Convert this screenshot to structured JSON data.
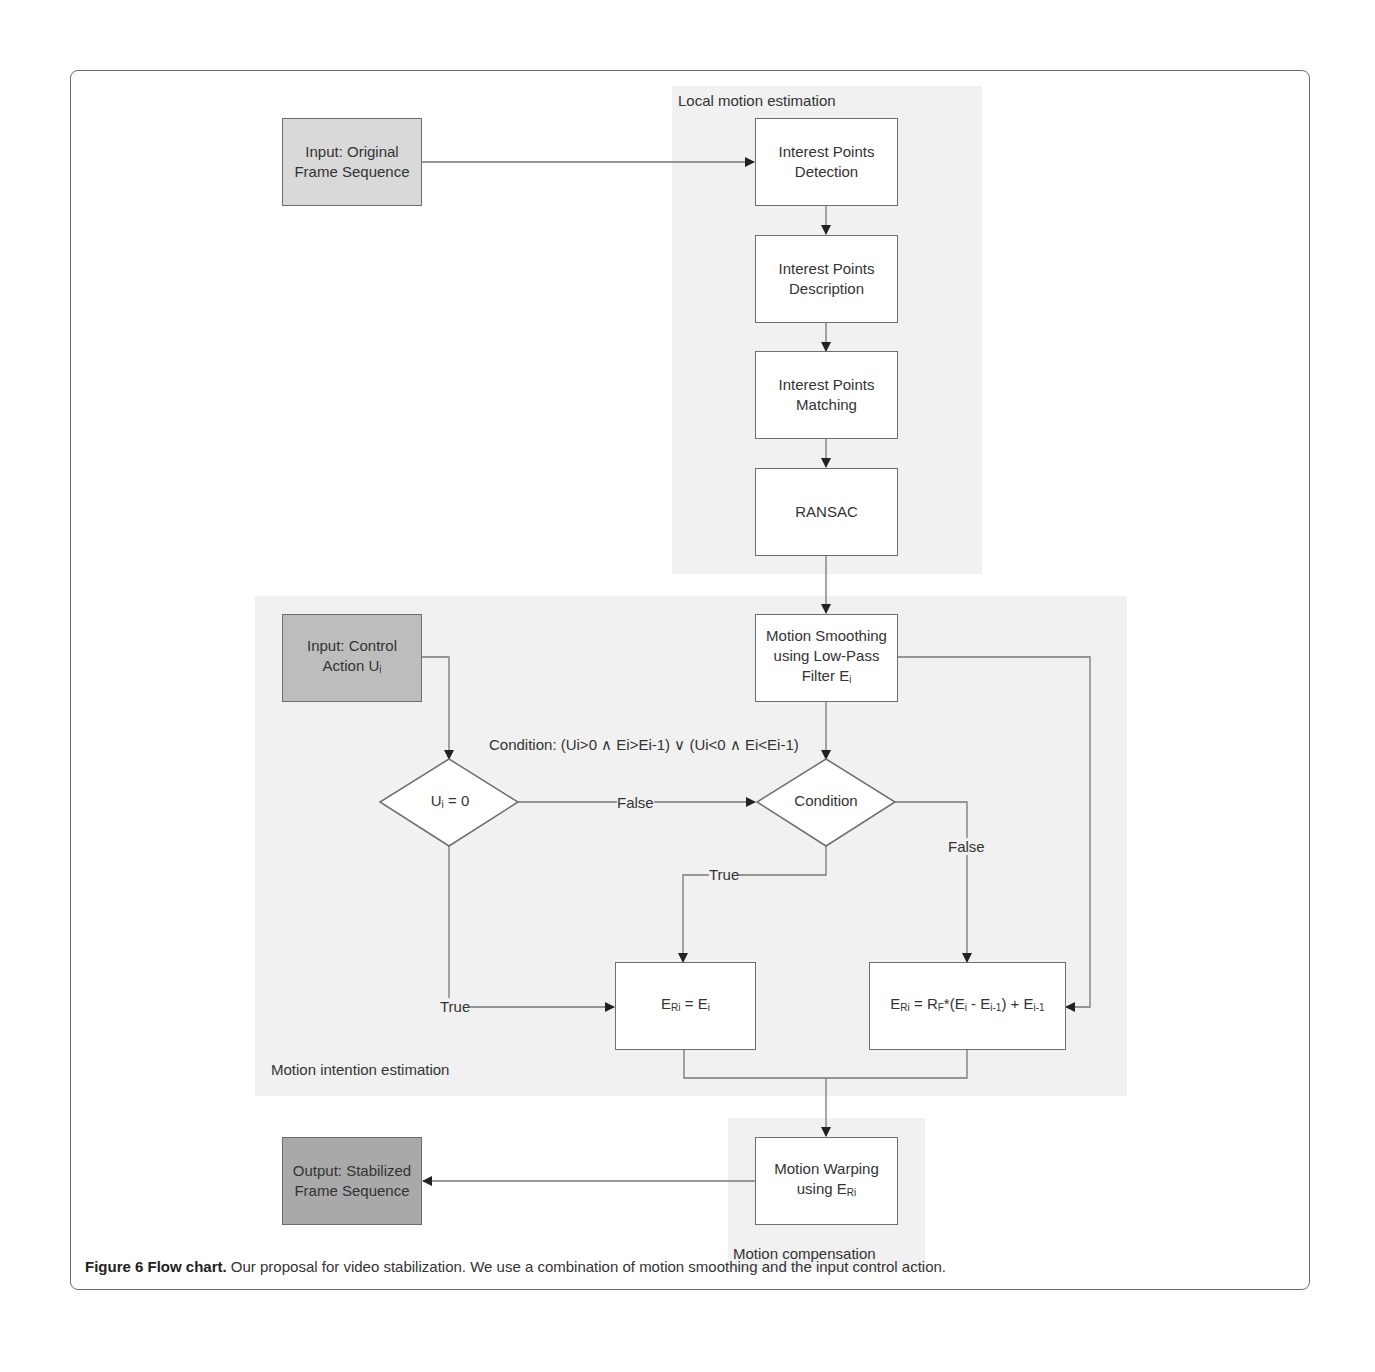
{
  "regions": {
    "local_motion": "Local motion estimation",
    "motion_intention": "Motion intention estimation",
    "motion_compensation": "Motion compensation"
  },
  "nodes": {
    "input_original": {
      "line1": "Input: Original",
      "line2": "Frame Sequence"
    },
    "ip_detection": {
      "line1": "Interest Points",
      "line2": "Detection"
    },
    "ip_description": {
      "line1": "Interest Points",
      "line2": "Description"
    },
    "ip_matching": {
      "line1": "Interest Points",
      "line2": "Matching"
    },
    "ransac": {
      "line1": "RANSAC"
    },
    "motion_smoothing": {
      "line1": "Motion Smoothing",
      "line2": "using Low-Pass",
      "line3": "Filter E",
      "line3_sub": "i"
    },
    "input_control": {
      "line1": "Input: Control",
      "line2": "Action U",
      "line2_sub": "i"
    },
    "ui_zero": {
      "pre": "U",
      "sub": "i",
      "post": " = 0"
    },
    "condition": {
      "text": "Condition"
    },
    "eri_ei": {
      "a": "E",
      "a_sub": "Ri",
      "b": " = E",
      "b_sub": "i"
    },
    "eri_formula": {
      "a": "E",
      "a_sub": "Ri",
      "b": " = R",
      "b_sub": "F",
      "c": "*(E",
      "c_sub": "i",
      "d": " - E",
      "d_sub": "i-1",
      "e": ") + E",
      "e_sub": "i-1"
    },
    "motion_warping": {
      "line1": "Motion Warping",
      "line2": "using E",
      "line2_sub": "Ri"
    },
    "output": {
      "line1": "Output: Stabilized",
      "line2": "Frame Sequence"
    }
  },
  "condition_label": "Condition: (Ui>0 ∧ Ei>Ei-1) ∨ (Ui<0 ∧ Ei<Ei-1)",
  "edge_labels": {
    "false_mid": "False",
    "false_right": "False",
    "true_cond": "True",
    "true_left": "True"
  },
  "caption": {
    "bold": "Figure 6 Flow chart.",
    "text": " Our proposal for video stabilization. We use a combination of motion smoothing and the input control action."
  }
}
